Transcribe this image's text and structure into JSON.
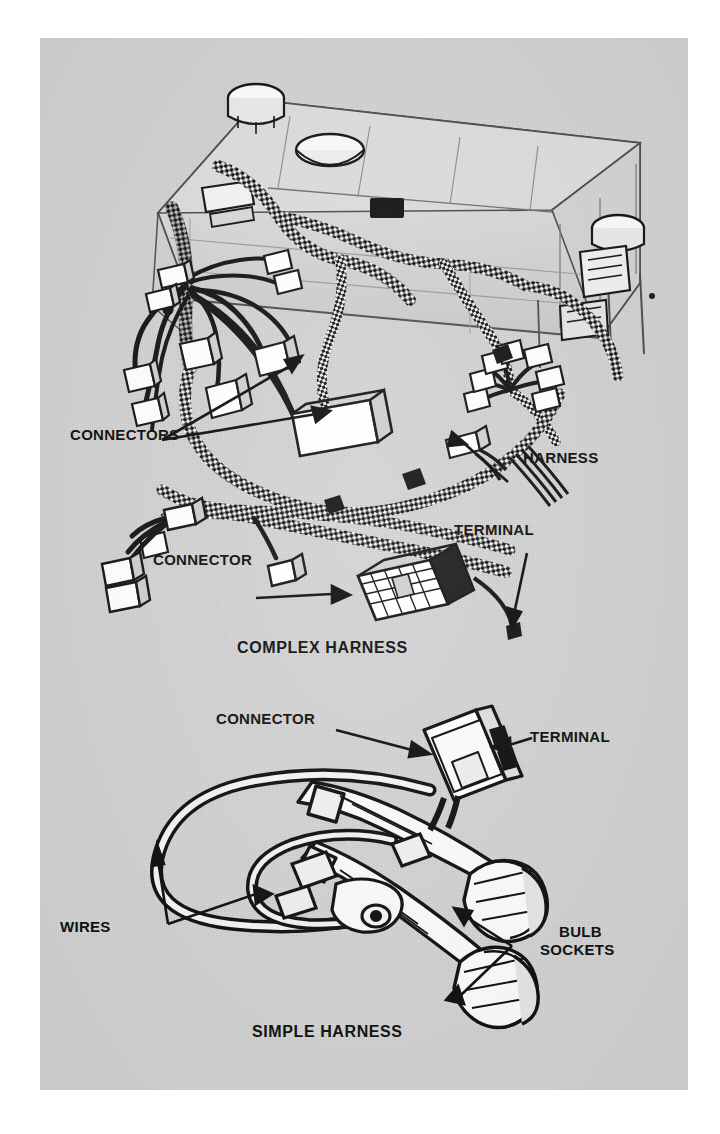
{
  "page": {
    "background_color": "#ffffff",
    "sheet_color": "#d7d7d7",
    "ink_color": "#0b0b0b"
  },
  "figures": [
    {
      "id": "complex-harness",
      "caption": "COMPLEX HARNESS",
      "subject": "instrument panel wiring harness assembly mounted on dashboard carrier",
      "callouts": [
        {
          "name": "connectors",
          "text": "CONNECTORS",
          "lines": 1
        },
        {
          "name": "harness",
          "text": "HARNESS",
          "lines": 1
        },
        {
          "name": "connector",
          "text": "CONNECTOR",
          "lines": 1
        },
        {
          "name": "terminal",
          "text": "TERMINAL",
          "lines": 1
        }
      ]
    },
    {
      "id": "simple-harness",
      "caption": "SIMPLE HARNESS",
      "subject": "two-wire lamp harness with connector and two bulb sockets",
      "callouts": [
        {
          "name": "connector",
          "text": "CONNECTOR",
          "lines": 1
        },
        {
          "name": "terminal",
          "text": "TERMINAL",
          "lines": 1
        },
        {
          "name": "wires",
          "text": "WIRES",
          "lines": 1
        },
        {
          "name": "bulb-sockets",
          "text_line1": "BULB",
          "text_line2": "SOCKETS",
          "lines": 2
        }
      ]
    }
  ],
  "labels": {
    "connectors_plural": "CONNECTORS",
    "harness": "HARNESS",
    "connector_complex": "CONNECTOR",
    "terminal_complex": "TERMINAL",
    "caption_complex": "COMPLEX HARNESS",
    "connector_simple": "CONNECTOR",
    "terminal_simple": "TERMINAL",
    "wires": "WIRES",
    "bulb_line1": "BULB",
    "bulb_line2": "SOCKETS",
    "caption_simple": "SIMPLE HARNESS"
  }
}
